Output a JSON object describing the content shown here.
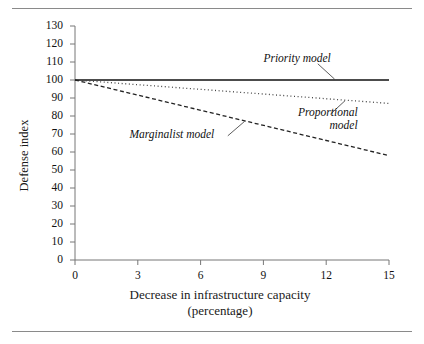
{
  "figure": {
    "has_top_rule": true,
    "has_bottom_rule": true,
    "rule_color": "#8a8a8a"
  },
  "chart_data": {
    "type": "line",
    "title": "",
    "xlabel_line1": "Decrease in infrastructure capacity",
    "xlabel_line2": "(percentage)",
    "ylabel": "Defense index",
    "xlim": [
      0,
      15
    ],
    "ylim": [
      0,
      130
    ],
    "grid": false,
    "legend_position": "inline-annotations",
    "xticks": [
      0,
      3,
      6,
      9,
      12,
      15
    ],
    "xtick_labels": [
      "0",
      "3",
      "6",
      "9",
      "12",
      "15"
    ],
    "yticks": [
      0,
      10,
      20,
      30,
      40,
      50,
      60,
      70,
      80,
      90,
      100,
      110,
      120,
      130
    ],
    "ytick_labels": [
      "0",
      "10",
      "20",
      "30",
      "40",
      "50",
      "60",
      "70",
      "80",
      "90",
      "100",
      "110",
      "120",
      "130"
    ],
    "x": [
      0,
      15
    ],
    "series": [
      {
        "name": "Priority model",
        "style": "solid",
        "color": "#111111",
        "values": [
          100,
          100
        ],
        "label": "Priority model",
        "label_x": 9.0,
        "label_y": 112,
        "leader_from": [
          11.6,
          109
        ],
        "leader_to": [
          12.4,
          100.5
        ]
      },
      {
        "name": "Proportional model",
        "style": "dotted",
        "color": "#444444",
        "values": [
          100,
          87
        ],
        "label_line1": "Proportional",
        "label_line2": "model",
        "label_x": 9.3,
        "label_y": 82,
        "leader_from": [
          12.2,
          81
        ],
        "leader_to": [
          12.9,
          88.5
        ]
      },
      {
        "name": "Marginalist model",
        "style": "dashed",
        "color": "#222222",
        "values": [
          100,
          58
        ],
        "label": "Marginalist model",
        "label_x": 2.6,
        "label_y": 70,
        "leader_from": [
          7.3,
          69
        ],
        "leader_to": [
          8.1,
          77
        ]
      }
    ]
  }
}
